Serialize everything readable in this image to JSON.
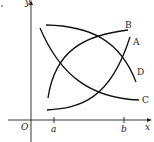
{
  "diagram": {
    "type": "function-graph",
    "axes": {
      "x_label": "x",
      "y_label": "y",
      "origin_label": "O",
      "ticks": [
        {
          "label": "a"
        },
        {
          "label": "b"
        }
      ]
    },
    "curves": [
      {
        "label": "A",
        "shape": "increasing, concave up"
      },
      {
        "label": "B",
        "shape": "increasing, concave down"
      },
      {
        "label": "C",
        "shape": "decreasing, concave up"
      },
      {
        "label": "D",
        "shape": "decreasing, concave down"
      }
    ],
    "colors": {
      "stroke": "#111111",
      "background": "#ffffff"
    }
  }
}
